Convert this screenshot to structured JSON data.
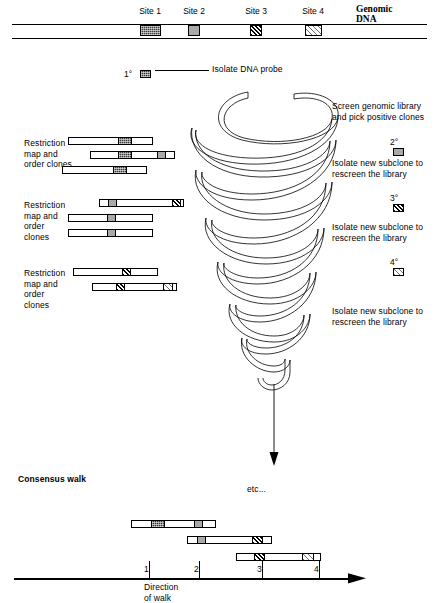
{
  "diagram": {
    "title_genomic": "Genomic DNA",
    "consensus_label": "Consensus walk",
    "etc_label": "etc...",
    "direction_label": "Direction of walk",
    "probe_label": "Isolate DNA probe",
    "probe_marker": "1°"
  },
  "sites": [
    {
      "label": "Site 1",
      "pattern": "dark-checker",
      "x": 140,
      "w": 21
    },
    {
      "label": "Site 2",
      "pattern": "gray",
      "x": 188,
      "w": 12
    },
    {
      "label": "Site 3",
      "pattern": "hatch-dark",
      "x": 250,
      "w": 12
    },
    {
      "label": "Site 4",
      "pattern": "hatch-light",
      "x": 305,
      "w": 17
    }
  ],
  "steps": [
    {
      "text": "Screen genomic library\nand pick positive clones",
      "marker": "2°",
      "marker_pattern": "gray"
    },
    {
      "text": "Isolate new subclone to\nrescreen the library",
      "marker": "3°",
      "marker_pattern": "hatch-dark"
    },
    {
      "text": "Isolate new subclone to\nrescreen the library",
      "marker": "4°",
      "marker_pattern": "hatch-light"
    },
    {
      "text": "Isolate new subclone to\nrescreen the library",
      "marker": "",
      "marker_pattern": ""
    }
  ],
  "clone_groups": [
    {
      "label": "Restriction\nmap and\norder clones",
      "clones": [
        {
          "x": 68,
          "w": 85,
          "blocks": [
            {
              "x": 49,
              "w": 14,
              "pattern": "dark-checker"
            }
          ]
        },
        {
          "x": 90,
          "w": 85,
          "blocks": [
            {
              "x": 27,
              "w": 14,
              "pattern": "dark-checker"
            },
            {
              "x": 66,
              "w": 9,
              "pattern": "gray"
            }
          ]
        },
        {
          "x": 62,
          "w": 85,
          "blocks": [
            {
              "x": 50,
              "w": 14,
              "pattern": "dark-checker"
            }
          ]
        }
      ]
    },
    {
      "label": "Restriction\nmap and\norder\nclones",
      "clones": [
        {
          "x": 99,
          "w": 85,
          "blocks": [
            {
              "x": 8,
              "w": 9,
              "pattern": "gray"
            },
            {
              "x": 72,
              "w": 9,
              "pattern": "hatch-dark"
            }
          ]
        },
        {
          "x": 68,
          "w": 85,
          "blocks": [
            {
              "x": 38,
              "w": 9,
              "pattern": "gray"
            }
          ]
        },
        {
          "x": 68,
          "w": 85,
          "blocks": [
            {
              "x": 38,
              "w": 9,
              "pattern": "gray"
            }
          ]
        }
      ]
    },
    {
      "label": "Restriction\nmap and\norder\nclones",
      "clones": [
        {
          "x": 73,
          "w": 85,
          "blocks": [
            {
              "x": 48,
              "w": 9,
              "pattern": "hatch-dark"
            }
          ]
        },
        {
          "x": 92,
          "w": 85,
          "blocks": [
            {
              "x": 23,
              "w": 9,
              "pattern": "hatch-dark"
            },
            {
              "x": 70,
              "w": 10,
              "pattern": "hatch-light"
            }
          ]
        }
      ]
    }
  ],
  "consensus_clones": [
    {
      "x": 131,
      "w": 85,
      "blocks": [
        {
          "x": 19,
          "w": 14,
          "pattern": "dark-checker"
        },
        {
          "x": 62,
          "w": 9,
          "pattern": "gray"
        }
      ]
    },
    {
      "x": 187,
      "w": 85,
      "blocks": [
        {
          "x": 9,
          "w": 9,
          "pattern": "gray"
        },
        {
          "x": 64,
          "w": 11,
          "pattern": "hatch-dark"
        }
      ]
    },
    {
      "x": 236,
      "w": 85,
      "blocks": [
        {
          "x": 17,
          "w": 11,
          "pattern": "hatch-dark"
        },
        {
          "x": 65,
          "w": 12,
          "pattern": "hatch-light"
        }
      ]
    }
  ],
  "axis": {
    "ticks": [
      {
        "label": "1",
        "x": 149
      },
      {
        "label": "2",
        "x": 199
      },
      {
        "label": "3",
        "x": 262
      },
      {
        "label": "4",
        "x": 319
      }
    ]
  }
}
